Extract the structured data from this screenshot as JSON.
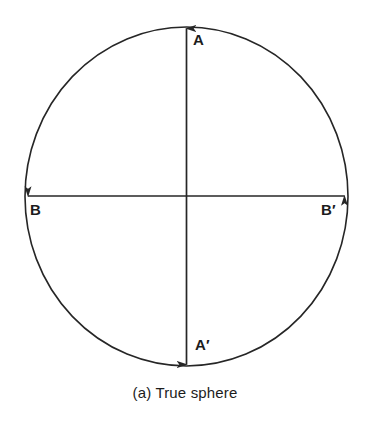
{
  "figure": {
    "caption": "(a) True sphere",
    "shape_name": "circle",
    "stroke_color": "#262626",
    "background_color": "#ffffff",
    "labels": {
      "top": "A",
      "bottom": "A′",
      "left": "B",
      "right": "B′"
    },
    "axes": [
      {
        "name": "vertical-axis",
        "from_label": "A",
        "to_label": "A′",
        "arrowheads": "both"
      },
      {
        "name": "horizontal-axis",
        "from_label": "B",
        "to_label": "B′",
        "arrowheads": "both"
      }
    ]
  }
}
